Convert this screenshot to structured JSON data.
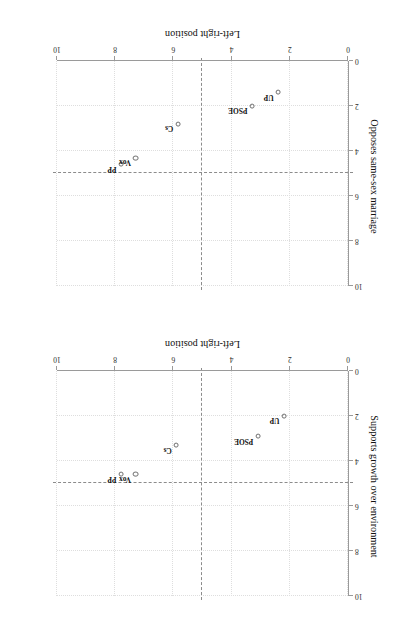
{
  "figure": {
    "title": "Spanish party voters on questions green & LGBTQ politics",
    "rotation_deg": 180
  },
  "chart_data": [
    {
      "type": "scatter",
      "panel_id": "supports-growth-over-environment",
      "title": "",
      "xlabel": "Left-right position",
      "ylabel": "Supports growth over environment",
      "xlim": [
        0,
        10
      ],
      "ylim": [
        0,
        10
      ],
      "xticks": [
        0,
        2,
        4,
        6,
        8,
        10
      ],
      "yticks": [
        0,
        2,
        4,
        6,
        8,
        10
      ],
      "grid": true,
      "legend": "none",
      "reference_lines": {
        "x": 5,
        "y": 5,
        "style": "dashed"
      },
      "points": [
        {
          "label": "PP",
          "x": 7.8,
          "y": 4.6
        },
        {
          "label": "Vox",
          "x": 7.3,
          "y": 4.6
        },
        {
          "label": "Cs",
          "x": 5.9,
          "y": 3.3
        },
        {
          "label": "PSOE",
          "x": 3.1,
          "y": 2.9
        },
        {
          "label": "UP",
          "x": 2.2,
          "y": 2.0
        }
      ]
    },
    {
      "type": "scatter",
      "panel_id": "opposes-same-sex-marriage",
      "title": "",
      "xlabel": "Left-right position",
      "ylabel": "Opposes same-sex marriage",
      "xlim": [
        0,
        10
      ],
      "ylim": [
        0,
        10
      ],
      "xticks": [
        0,
        2,
        4,
        6,
        8,
        10
      ],
      "yticks": [
        0,
        2,
        4,
        6,
        8,
        10
      ],
      "grid": true,
      "legend": "none",
      "reference_lines": {
        "x": 5,
        "y": 5,
        "style": "dashed"
      },
      "points": [
        {
          "label": "PP",
          "x": 7.8,
          "y": 4.6
        },
        {
          "label": "Vox",
          "x": 7.3,
          "y": 4.3
        },
        {
          "label": "Cs",
          "x": 5.85,
          "y": 2.8
        },
        {
          "label": "PSOE",
          "x": 3.3,
          "y": 2.0
        },
        {
          "label": "UP",
          "x": 2.4,
          "y": 1.4
        }
      ]
    }
  ],
  "colors": {
    "point_stroke": "#6e6e6e",
    "axis": "#9a9a9a",
    "grid": "#dedede",
    "reference_line": "#8c8c8c",
    "text": "#111111",
    "background": "#ffffff"
  }
}
